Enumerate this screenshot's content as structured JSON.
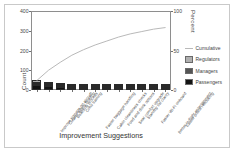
{
  "chart_data": {
    "type": "bar",
    "title": "",
    "xlabel": "Improvement Suggestions",
    "ylabel": "Count",
    "y2label": "Percent",
    "ylim": [
      0,
      400
    ],
    "y2lim": [
      0,
      100
    ],
    "yticks": [
      "0",
      "100",
      "200",
      "300",
      "400"
    ],
    "ytick_values": [
      0,
      100,
      200,
      300,
      400
    ],
    "y2ticks": [
      "0",
      "50",
      "100"
    ],
    "y2tick_values": [
      0,
      50,
      100
    ],
    "grid": false,
    "legend_position": "right",
    "categories": [
      "Improve signage on aircraft",
      "Clearer safety briefing",
      "Boarding process",
      "Crew training",
      "Faster baggage handling",
      "Cabin cleanliness checks",
      "Food and drink options",
      "Seat comfort upgrade",
      "Standby list clarity",
      "Faster Wi-Fi onboard",
      "Better in-flight entertainment",
      "Easier online rebooking"
    ],
    "series": [
      {
        "name": "Passengers",
        "color": "#131313",
        "values": [
          24,
          20,
          14,
          12,
          8,
          8,
          7,
          6,
          6,
          5,
          5,
          3
        ]
      },
      {
        "name": "Managers",
        "color": "#555555",
        "values": [
          14,
          10,
          6,
          4,
          3,
          3,
          3,
          2,
          2,
          2,
          2,
          1
        ]
      },
      {
        "name": "Regulators",
        "color": "#b0b0b0",
        "values": [
          12,
          7,
          4,
          2,
          2,
          2,
          1,
          1,
          1,
          1,
          1,
          1
        ]
      }
    ],
    "totals": [
      50,
      37,
      24,
      18,
      13,
      13,
      11,
      9,
      9,
      8,
      8,
      5
    ],
    "cumulative_name": "Cumulative",
    "cumulative_color": "#b9b9b9",
    "cumulative_percent": [
      12,
      25,
      35,
      44,
      51,
      57,
      62,
      67,
      71,
      74,
      77,
      79
    ]
  },
  "legend": {
    "items": [
      {
        "label": "Cumulative",
        "type": "line",
        "color": "#b9b9b9"
      },
      {
        "label": "Regulators",
        "type": "swatch",
        "color": "#b0b0b0"
      },
      {
        "label": "Managers",
        "type": "swatch",
        "color": "#555555"
      },
      {
        "label": "Passengers",
        "type": "swatch",
        "color": "#131313"
      }
    ]
  }
}
